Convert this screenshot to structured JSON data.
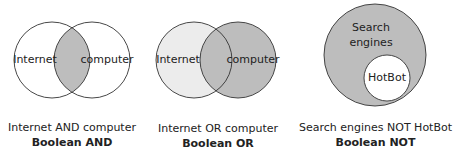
{
  "colors": {
    "stroke": "#333333",
    "shade": "#bdbdbd",
    "light": "#ececec",
    "background": "#ffffff"
  },
  "diagrams": [
    {
      "id": "and",
      "labels": [
        "Internet",
        "computer"
      ],
      "caption": "Internet AND computer",
      "title": "Boolean AND"
    },
    {
      "id": "or",
      "labels": [
        "Internet",
        "computer"
      ],
      "caption": "Internet OR computer",
      "title": "Boolean OR"
    },
    {
      "id": "not",
      "labels": [
        "Search",
        "engines",
        "HotBot"
      ],
      "caption": "Search engines NOT HotBot",
      "title": "Boolean NOT"
    }
  ]
}
